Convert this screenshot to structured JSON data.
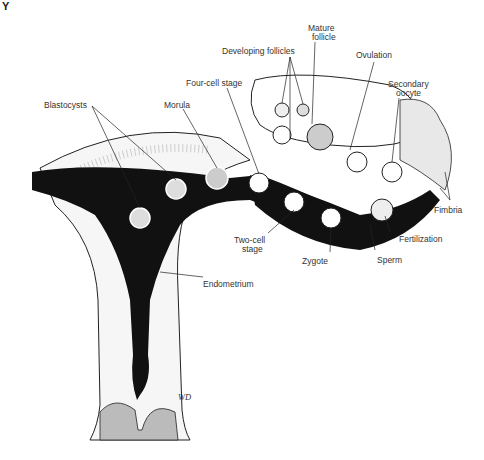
{
  "figure": {
    "corner_label": "Y",
    "signature": "WD"
  },
  "labels": {
    "developing_follicles": "Developing follicles",
    "mature_follicle_1": "Mature",
    "mature_follicle_2": "follicle",
    "ovulation": "Ovulation",
    "secondary_oocyte_1": "Secondary",
    "secondary_oocyte_2": "oocyte",
    "four_cell_stage": "Four-cell stage",
    "blastocysts": "Blastocysts",
    "morula": "Morula",
    "fimbria": "Fimbria",
    "fertilization": "Fertilization",
    "two_cell_stage_1": "Two-cell",
    "two_cell_stage_2": "stage",
    "zygote": "Zygote",
    "sperm": "Sperm",
    "endometrium": "Endometrium"
  },
  "colors": {
    "ink": "#111111",
    "stipple": "#bdbdbd",
    "paper": "#ffffff"
  }
}
